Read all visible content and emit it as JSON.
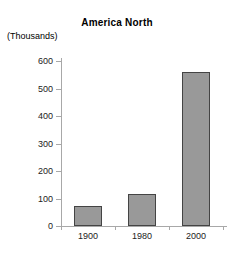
{
  "chart_data": {
    "type": "bar",
    "title": "America North",
    "xlabel": "",
    "ylabel": "(Thousands)",
    "categories": [
      "1900",
      "1980",
      "2000"
    ],
    "values": [
      73,
      115,
      560
    ],
    "ylim": [
      0,
      600
    ],
    "yticks": [
      "0",
      "100",
      "200",
      "300",
      "400",
      "500",
      "600"
    ],
    "grid": false,
    "legend": false,
    "series": [
      {
        "name": "America North",
        "values": [
          73,
          115,
          560
        ]
      }
    ],
    "colors": {
      "bar_fill": "#999999",
      "bar_border": "#444444",
      "axis": "#a8a8a8",
      "text": "#000000",
      "background": "#ffffff"
    }
  }
}
